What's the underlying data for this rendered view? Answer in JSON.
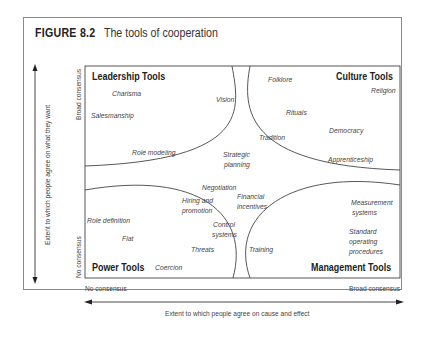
{
  "figure": {
    "number": "FIGURE 8.2",
    "caption": "The tools of cooperation"
  },
  "quadrants": {
    "leadership": {
      "title": "Leadership Tools",
      "items": [
        "Charisma",
        "Vision",
        "Salesmanship",
        "Role modeling"
      ]
    },
    "culture": {
      "title": "Culture Tools",
      "items": [
        "Folklore",
        "Religion",
        "Rituals",
        "Tradition",
        "Democracy",
        "Apprenticeship"
      ]
    },
    "power": {
      "title": "Power Tools",
      "items": [
        "Role definition",
        "Fiat",
        "Threats",
        "Coercion"
      ]
    },
    "management": {
      "title": "Management Tools",
      "items": [
        "Measurement",
        "systems",
        "Standard",
        "operating",
        "procedures",
        "Training"
      ]
    }
  },
  "center_items": {
    "strategic_1": "Strategic",
    "strategic_2": "planning",
    "negotiation": "Negotiation",
    "hiring_1": "Hiring and",
    "hiring_2": "promotion",
    "financial_1": "Financial",
    "financial_2": "incentives",
    "control_1": "Control",
    "control_2": "systems"
  },
  "axes": {
    "y_label": "Extent to which people agree on what they want",
    "y_top": "Broad consensus",
    "y_bottom": "No consensus",
    "x_label": "Extent to which people agree on cause and effect",
    "x_left": "No consensus",
    "x_right": "Broad consensus"
  },
  "colors": {
    "line": "#444444",
    "frame": "#8a8a8a",
    "text": "#333333"
  }
}
